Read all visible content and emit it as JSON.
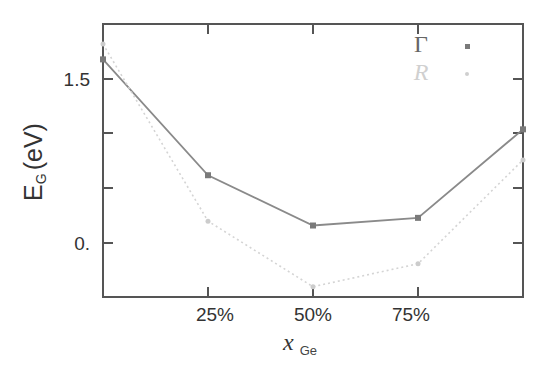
{
  "chart_data": {
    "type": "line",
    "title": "",
    "xlabel": "x",
    "xlabel_subscript": "Ge",
    "ylabel": "E",
    "ylabel_subscript": "G",
    "ylabel_unit": "(eV)",
    "x": [
      0,
      25,
      50,
      75,
      100
    ],
    "xlim": [
      0,
      100
    ],
    "ylim": [
      -0.5,
      2.0
    ],
    "x_ticks": [
      {
        "value": 25,
        "label": "25%"
      },
      {
        "value": 50,
        "label": "50%"
      },
      {
        "value": 75,
        "label": "75%"
      }
    ],
    "y_ticks": [
      {
        "value": 0.0,
        "label": "0."
      },
      {
        "value": 0.5,
        "label": ""
      },
      {
        "value": 1.0,
        "label": ""
      },
      {
        "value": 1.5,
        "label": "1.5"
      }
    ],
    "grid": false,
    "legend_position": "top-right",
    "series": [
      {
        "name": "Γ",
        "values": [
          1.68,
          0.62,
          0.16,
          0.23,
          1.04
        ],
        "color": "#8a8a8a",
        "marker": "square",
        "style": "solid"
      },
      {
        "name": "R",
        "values": [
          1.82,
          0.2,
          -0.4,
          -0.19,
          0.76
        ],
        "color": "#d4d4d4",
        "marker": "dot",
        "style": "dotted"
      }
    ]
  },
  "labels": {
    "ytick_top": "1.5",
    "ytick_zero": "0.",
    "xtick_25": "25%",
    "xtick_50": "50%",
    "xtick_75": "75%",
    "ylabel_main": "E",
    "ylabel_sub": "G",
    "ylabel_unit": "(eV)",
    "xlabel_main": "x",
    "xlabel_sub": "Ge",
    "legend_gamma": "Γ",
    "legend_r": "R"
  }
}
